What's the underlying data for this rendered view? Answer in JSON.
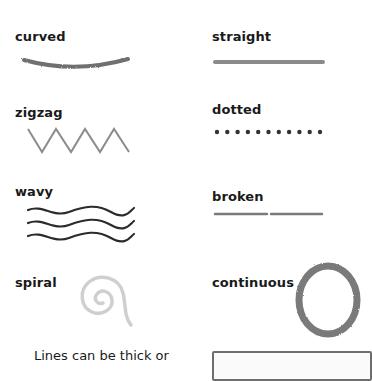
{
  "items": [
    {
      "id": "curved",
      "label": "curved",
      "style": "textured-gray"
    },
    {
      "id": "straight",
      "label": "straight",
      "style": "solid-gray"
    },
    {
      "id": "zigzag",
      "label": "zigzag",
      "style": "thin-gray"
    },
    {
      "id": "dotted",
      "label": "dotted",
      "style": "dark-dots",
      "dot_count": 11
    },
    {
      "id": "wavy",
      "label": "wavy",
      "style": "dark-lines",
      "line_count": 3
    },
    {
      "id": "broken",
      "label": "broken",
      "style": "gray-segments",
      "segment_count": 2
    },
    {
      "id": "spiral",
      "label": "spiral",
      "style": "light-gray"
    },
    {
      "id": "continuous",
      "label": "continuous",
      "style": "textured-gray-circle"
    }
  ],
  "caption": "Lines can be thick or",
  "colors": {
    "text": "#1a1a1a",
    "textured_gray": "#6f6f6f",
    "solid_gray": "#8a8a8a",
    "zigzag_gray": "#8c8c8c",
    "dots": "#333333",
    "wavy": "#2b2b2b",
    "broken": "#7a7a7a",
    "spiral": "#cfcfcf"
  }
}
